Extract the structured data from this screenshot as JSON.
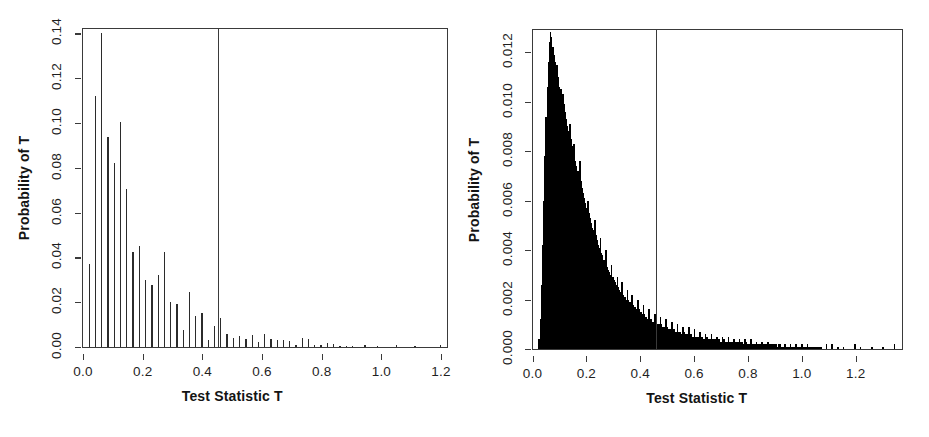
{
  "figure": {
    "background": "#ffffff",
    "ink": "#2b2b2b",
    "panel_count": 2
  },
  "chart_data": [
    {
      "type": "bar",
      "panel": "left",
      "title": "",
      "xlabel": "Test Statistic T",
      "ylabel": "Probability of T",
      "xlim": [
        0.0,
        1.22
      ],
      "ylim": [
        0.0,
        0.142
      ],
      "grid": false,
      "legend": null,
      "xticks": [
        "0.0",
        "0.2",
        "0.4",
        "0.6",
        "0.8",
        "1.0",
        "1.2"
      ],
      "xtick_values": [
        0.0,
        0.2,
        0.4,
        0.6,
        0.8,
        1.0,
        1.2
      ],
      "yticks": [
        "0.00",
        "0.02",
        "0.04",
        "0.06",
        "0.08",
        "0.10",
        "0.12",
        "0.14"
      ],
      "ytick_values": [
        0.0,
        0.02,
        0.04,
        0.06,
        0.08,
        0.1,
        0.12,
        0.14
      ],
      "annotations": [
        {
          "name": "observed-statistic-line",
          "type": "vline",
          "x": 0.453
        }
      ],
      "x": [
        0.021,
        0.042,
        0.063,
        0.084,
        0.105,
        0.126,
        0.147,
        0.168,
        0.189,
        0.21,
        0.231,
        0.252,
        0.273,
        0.294,
        0.315,
        0.336,
        0.357,
        0.378,
        0.399,
        0.42,
        0.441,
        0.462,
        0.483,
        0.504,
        0.525,
        0.546,
        0.567,
        0.588,
        0.609,
        0.63,
        0.651,
        0.672,
        0.693,
        0.714,
        0.735,
        0.756,
        0.777,
        0.798,
        0.819,
        0.84,
        0.861,
        0.882,
        0.903,
        0.945,
        0.987,
        1.05,
        1.113,
        1.197
      ],
      "values": [
        0.0372,
        0.1122,
        0.14,
        0.094,
        0.082,
        0.1005,
        0.0705,
        0.0425,
        0.045,
        0.03,
        0.0275,
        0.032,
        0.0425,
        0.02,
        0.019,
        0.0075,
        0.0245,
        0.014,
        0.015,
        0.003,
        0.0095,
        0.0128,
        0.006,
        0.004,
        0.005,
        0.0035,
        0.0055,
        0.0022,
        0.006,
        0.0035,
        0.003,
        0.003,
        0.0028,
        0.001,
        0.004,
        0.0038,
        0.001,
        0.001,
        0.0016,
        0.0014,
        0.0006,
        0.0006,
        0.0006,
        0.0009,
        0.0006,
        0.0009,
        0.0006,
        0.0008
      ]
    },
    {
      "type": "bar",
      "panel": "right",
      "title": "",
      "xlabel": "Test Statistic T",
      "ylabel": "Probability of T",
      "xlim": [
        0.0,
        1.37
      ],
      "ylim": [
        0.0,
        0.0129
      ],
      "grid": false,
      "legend": null,
      "xticks": [
        "0.0",
        "0.2",
        "0.4",
        "0.6",
        "0.8",
        "1.0",
        "1.2"
      ],
      "xtick_values": [
        0.0,
        0.2,
        0.4,
        0.6,
        0.8,
        1.0,
        1.2
      ],
      "yticks": [
        "0.000",
        "0.002",
        "0.004",
        "0.006",
        "0.008",
        "0.010",
        "0.012"
      ],
      "ytick_values": [
        0.0,
        0.002,
        0.004,
        0.006,
        0.008,
        0.01,
        0.012
      ],
      "annotations": [
        {
          "name": "observed-statistic-line",
          "type": "vline",
          "x": 0.46
        }
      ],
      "bin_width": 0.0042,
      "x": [
        0.025,
        0.029,
        0.034,
        0.038,
        0.042,
        0.046,
        0.05,
        0.055,
        0.059,
        0.063,
        0.067,
        0.071,
        0.076,
        0.08,
        0.084,
        0.088,
        0.092,
        0.097,
        0.101,
        0.105,
        0.109,
        0.113,
        0.118,
        0.122,
        0.126,
        0.13,
        0.134,
        0.139,
        0.143,
        0.147,
        0.151,
        0.155,
        0.16,
        0.164,
        0.168,
        0.172,
        0.176,
        0.181,
        0.185,
        0.189,
        0.193,
        0.197,
        0.202,
        0.206,
        0.21,
        0.214,
        0.218,
        0.223,
        0.227,
        0.231,
        0.235,
        0.239,
        0.244,
        0.248,
        0.252,
        0.256,
        0.26,
        0.265,
        0.269,
        0.273,
        0.277,
        0.281,
        0.286,
        0.29,
        0.294,
        0.298,
        0.302,
        0.307,
        0.311,
        0.315,
        0.319,
        0.323,
        0.328,
        0.332,
        0.336,
        0.34,
        0.344,
        0.349,
        0.353,
        0.357,
        0.361,
        0.365,
        0.37,
        0.374,
        0.378,
        0.382,
        0.386,
        0.391,
        0.395,
        0.399,
        0.403,
        0.407,
        0.412,
        0.416,
        0.42,
        0.424,
        0.428,
        0.433,
        0.437,
        0.441,
        0.445,
        0.449,
        0.454,
        0.458,
        0.462,
        0.466,
        0.47,
        0.475,
        0.479,
        0.483,
        0.487,
        0.491,
        0.496,
        0.5,
        0.504,
        0.508,
        0.512,
        0.517,
        0.521,
        0.525,
        0.529,
        0.533,
        0.538,
        0.542,
        0.546,
        0.55,
        0.554,
        0.559,
        0.563,
        0.567,
        0.571,
        0.575,
        0.58,
        0.584,
        0.588,
        0.592,
        0.596,
        0.601,
        0.605,
        0.609,
        0.613,
        0.617,
        0.622,
        0.626,
        0.63,
        0.634,
        0.638,
        0.643,
        0.647,
        0.651,
        0.655,
        0.659,
        0.664,
        0.668,
        0.672,
        0.676,
        0.68,
        0.685,
        0.689,
        0.693,
        0.697,
        0.701,
        0.706,
        0.71,
        0.714,
        0.718,
        0.722,
        0.727,
        0.731,
        0.735,
        0.739,
        0.743,
        0.748,
        0.752,
        0.756,
        0.76,
        0.764,
        0.769,
        0.773,
        0.777,
        0.781,
        0.785,
        0.79,
        0.794,
        0.798,
        0.802,
        0.806,
        0.811,
        0.815,
        0.819,
        0.823,
        0.827,
        0.832,
        0.836,
        0.84,
        0.844,
        0.848,
        0.853,
        0.857,
        0.861,
        0.865,
        0.869,
        0.874,
        0.878,
        0.882,
        0.886,
        0.89,
        0.895,
        0.899,
        0.903,
        0.907,
        0.911,
        0.916,
        0.92,
        0.924,
        0.928,
        0.932,
        0.937,
        0.941,
        0.945,
        0.949,
        0.953,
        0.958,
        0.962,
        0.966,
        0.97,
        0.974,
        0.979,
        0.983,
        0.987,
        0.991,
        0.995,
        1.0,
        1.004,
        1.008,
        1.012,
        1.016,
        1.021,
        1.025,
        1.029,
        1.033,
        1.037,
        1.042,
        1.046,
        1.05,
        1.054,
        1.058,
        1.063,
        1.067,
        1.071,
        1.092,
        1.113,
        1.134,
        1.155,
        1.197,
        1.218,
        1.26,
        1.302,
        1.344
      ],
      "values": [
        0.0004,
        0.0012,
        0.0026,
        0.0042,
        0.006,
        0.0078,
        0.0094,
        0.0106,
        0.0116,
        0.0124,
        0.0128,
        0.0126,
        0.0122,
        0.0119,
        0.0116,
        0.0112,
        0.0115,
        0.011,
        0.0106,
        0.0105,
        0.0102,
        0.0103,
        0.0099,
        0.0096,
        0.0093,
        0.009,
        0.0088,
        0.0091,
        0.0085,
        0.0082,
        0.008,
        0.0083,
        0.0076,
        0.0074,
        0.0072,
        0.007,
        0.0076,
        0.0068,
        0.0065,
        0.0063,
        0.0061,
        0.0059,
        0.0057,
        0.006,
        0.0055,
        0.0053,
        0.0051,
        0.0049,
        0.0048,
        0.0052,
        0.0046,
        0.0044,
        0.0042,
        0.0041,
        0.0045,
        0.0039,
        0.0038,
        0.0036,
        0.0035,
        0.004,
        0.0033,
        0.0032,
        0.0031,
        0.003,
        0.0034,
        0.0029,
        0.0028,
        0.0027,
        0.0026,
        0.0029,
        0.0025,
        0.0024,
        0.0023,
        0.0027,
        0.0022,
        0.0021,
        0.0021,
        0.002,
        0.0024,
        0.002,
        0.0019,
        0.0018,
        0.0022,
        0.0018,
        0.0017,
        0.0017,
        0.0016,
        0.002,
        0.0016,
        0.0015,
        0.0015,
        0.0014,
        0.0018,
        0.0014,
        0.0013,
        0.0013,
        0.0012,
        0.0016,
        0.0012,
        0.0012,
        0.0011,
        0.0011,
        0.0014,
        0.0011,
        0.001,
        0.001,
        0.001,
        0.0013,
        0.001,
        0.0009,
        0.0009,
        0.0009,
        0.0012,
        0.0009,
        0.0008,
        0.0008,
        0.0008,
        0.0011,
        0.0008,
        0.0008,
        0.0007,
        0.0007,
        0.001,
        0.0007,
        0.0007,
        0.0007,
        0.0006,
        0.0009,
        0.0007,
        0.0006,
        0.0006,
        0.0006,
        0.0009,
        0.0006,
        0.0006,
        0.0005,
        0.0005,
        0.0008,
        0.0005,
        0.0005,
        0.0005,
        0.0005,
        0.0007,
        0.0005,
        0.0005,
        0.0004,
        0.0004,
        0.0006,
        0.0005,
        0.0004,
        0.0004,
        0.0004,
        0.0006,
        0.0004,
        0.0004,
        0.0004,
        0.0004,
        0.0005,
        0.0004,
        0.0004,
        0.0003,
        0.0003,
        0.0005,
        0.0004,
        0.0003,
        0.0003,
        0.0003,
        0.0005,
        0.0003,
        0.0003,
        0.0003,
        0.0003,
        0.0004,
        0.0003,
        0.0003,
        0.0003,
        0.0003,
        0.0004,
        0.0003,
        0.0003,
        0.0002,
        0.0002,
        0.0004,
        0.0003,
        0.0002,
        0.0002,
        0.0002,
        0.0004,
        0.0002,
        0.0002,
        0.0002,
        0.0002,
        0.0003,
        0.0002,
        0.0002,
        0.0002,
        0.0002,
        0.0003,
        0.0002,
        0.0002,
        0.0002,
        0.0002,
        0.0003,
        0.0002,
        0.0002,
        0.0002,
        0.0002,
        0.0002,
        0.0002,
        0.0002,
        0.0001,
        0.0001,
        0.0002,
        0.0002,
        0.0001,
        0.0001,
        0.0001,
        0.0002,
        0.0001,
        0.0001,
        0.0001,
        0.0001,
        0.0002,
        0.0001,
        0.0001,
        0.0001,
        0.0001,
        0.0002,
        0.0001,
        0.0001,
        0.0001,
        0.0001,
        0.0002,
        0.0001,
        0.0001,
        0.0001,
        0.0001,
        0.0002,
        0.0001,
        0.0001,
        0.0001,
        0.0001,
        0.0001,
        0.0001,
        0.0001,
        0.0001,
        0.0001,
        0.0001,
        0.0001,
        0.0001,
        0.0002,
        0.0002,
        0.0001,
        0.0001,
        0.0002,
        0.0001,
        0.0001,
        0.0001,
        0.0002
      ]
    }
  ]
}
